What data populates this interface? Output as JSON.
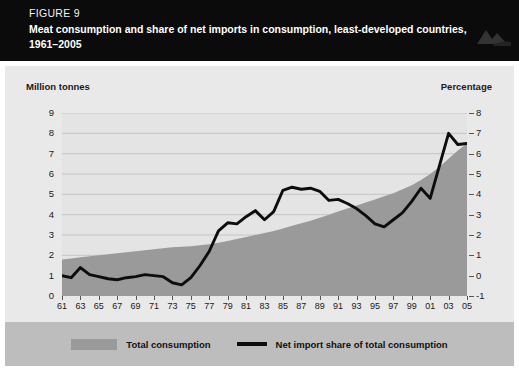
{
  "header": {
    "figure_number": "FIGURE 9",
    "title": "Meat consumption and share of net imports in consumption, least-developed countries, 1961–2005"
  },
  "axes": {
    "left_title": "Million tonnes",
    "right_title": "Percentage",
    "left_ticks": [
      "9",
      "8",
      "7",
      "6",
      "5",
      "4",
      "3",
      "2",
      "1",
      "0"
    ],
    "right_ticks": [
      "8",
      "7",
      "6",
      "5",
      "4",
      "3",
      "2",
      "1",
      "0",
      "-1"
    ]
  },
  "legend": {
    "items": [
      {
        "label": "Total consumption",
        "marker": "area-swatch",
        "color": "#9a9a9a"
      },
      {
        "label": "Net import share of total consumption",
        "marker": "line-swatch",
        "color": "#0d0d0d"
      }
    ]
  },
  "chart_data": {
    "type": "area",
    "title": "Meat consumption and share of net imports in consumption, least-developed countries, 1961–2005",
    "xlabel": "",
    "ylabel": "Million tonnes",
    "y2label": "Percentage",
    "ylim": [
      0,
      9
    ],
    "y2lim": [
      -1,
      8
    ],
    "grid": true,
    "legend_position": "bottom",
    "x": [
      1961,
      1962,
      1963,
      1964,
      1965,
      1966,
      1967,
      1968,
      1969,
      1970,
      1971,
      1972,
      1973,
      1974,
      1975,
      1976,
      1977,
      1978,
      1979,
      1980,
      1981,
      1982,
      1983,
      1984,
      1985,
      1986,
      1987,
      1988,
      1989,
      1990,
      1991,
      1992,
      1993,
      1994,
      1995,
      1996,
      1997,
      1998,
      1999,
      2000,
      2001,
      2002,
      2003,
      2004,
      2005
    ],
    "tick_labels": [
      "61",
      "63",
      "65",
      "67",
      "69",
      "71",
      "73",
      "75",
      "77",
      "79",
      "81",
      "83",
      "85",
      "87",
      "89",
      "91",
      "93",
      "95",
      "97",
      "99",
      "01",
      "03",
      "05"
    ],
    "series": [
      {
        "name": "Total consumption",
        "unit": "million tonnes",
        "axis": "left",
        "type": "area",
        "color": "#9a9a9a",
        "values": [
          1.8,
          1.85,
          1.9,
          1.95,
          2.0,
          2.05,
          2.1,
          2.15,
          2.2,
          2.25,
          2.3,
          2.35,
          2.4,
          2.42,
          2.45,
          2.5,
          2.55,
          2.62,
          2.7,
          2.8,
          2.9,
          3.0,
          3.1,
          3.2,
          3.32,
          3.45,
          3.58,
          3.7,
          3.85,
          4.0,
          4.15,
          4.3,
          4.45,
          4.6,
          4.75,
          4.9,
          5.05,
          5.25,
          5.45,
          5.7,
          6.0,
          6.35,
          6.75,
          7.15,
          7.5
        ]
      },
      {
        "name": "Net import share of total consumption",
        "unit": "percentage",
        "axis": "right",
        "type": "line",
        "color": "#0d0d0d",
        "values": [
          0.0,
          -0.1,
          0.4,
          0.05,
          -0.05,
          -0.15,
          -0.2,
          -0.1,
          -0.05,
          0.05,
          0.0,
          -0.05,
          -0.35,
          -0.45,
          -0.1,
          0.5,
          1.2,
          2.2,
          2.6,
          2.55,
          2.9,
          3.2,
          2.75,
          3.15,
          4.2,
          4.35,
          4.25,
          4.3,
          4.15,
          3.7,
          3.75,
          3.55,
          3.3,
          2.95,
          2.55,
          2.4,
          2.75,
          3.1,
          3.65,
          4.3,
          3.8,
          5.4,
          7.0,
          6.45,
          6.5
        ]
      }
    ]
  }
}
